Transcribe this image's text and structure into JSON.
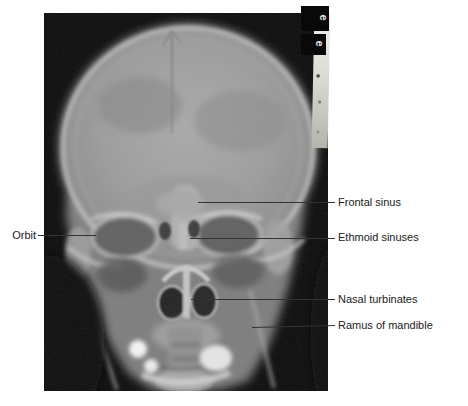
{
  "figure": {
    "kind": "radiograph",
    "page_background": "#ffffff",
    "film_background": "#0b0b0b",
    "label_text_color": "#212121",
    "leader_line_color": "#333333"
  },
  "annotations": [
    {
      "id": "orbit",
      "label": "Orbit",
      "side": "left"
    },
    {
      "id": "frontal-sinus",
      "label": "Frontal sinus",
      "side": "right"
    },
    {
      "id": "ethmoid-sinuses",
      "label": "Ethmoid sinuses",
      "side": "right"
    },
    {
      "id": "nasal-turbinates",
      "label": "Nasal turbinates",
      "side": "right"
    },
    {
      "id": "ramus-of-mandible",
      "label": "Ramus of mandible",
      "side": "right"
    }
  ],
  "film_marker": {
    "letters": [
      "e",
      "e"
    ]
  }
}
